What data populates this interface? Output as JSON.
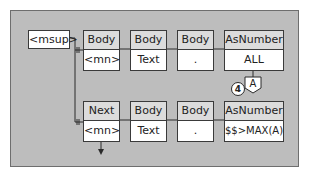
{
  "diagram": {
    "source_node": {
      "label": "<msup>"
    },
    "rows": [
      {
        "nodes": [
          {
            "header": "Body",
            "value": "<mn>"
          },
          {
            "header": "Body",
            "value": "Text"
          },
          {
            "header": "Body",
            "value": "."
          },
          {
            "header": "AsNumber",
            "value": "ALL"
          }
        ]
      },
      {
        "nodes": [
          {
            "header": "Next",
            "value": "<mn>"
          },
          {
            "header": "Body",
            "value": "Text"
          },
          {
            "header": "Body",
            "value": "."
          },
          {
            "header": "AsNumber",
            "value": "$$>MAX(A)"
          }
        ]
      }
    ],
    "variable_badge": {
      "label": "A"
    },
    "step_marker": {
      "label": "4"
    }
  },
  "colors": {
    "panel": "#bdbdbd",
    "header": "#dcdcdc",
    "value": "#ffffff",
    "stroke": "#2a2a2a"
  }
}
